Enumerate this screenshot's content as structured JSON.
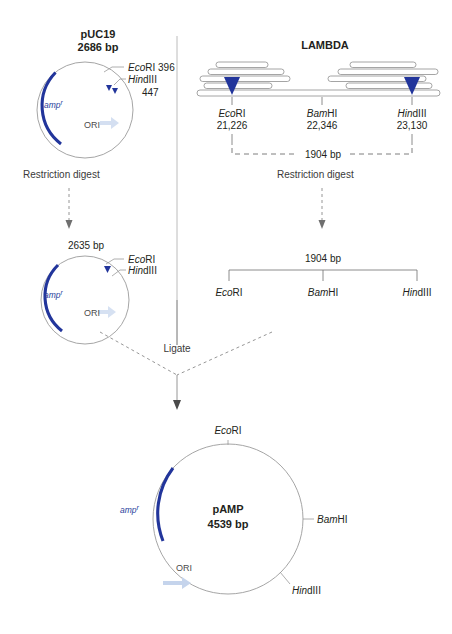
{
  "figure": {
    "colors": {
      "amp_arc": "#22359b",
      "cut_site_marker": "#22359b",
      "ori_arrow": "#c5d4ec",
      "outline": "#9b9b9b",
      "text": "#231f20"
    }
  },
  "panels": {
    "puc19": {
      "name": "pUC19",
      "size": "2686 bp",
      "gene_label": "amp",
      "gene_superscript": "r",
      "ori_label": "ORI",
      "sites": [
        {
          "enzyme_italic": "Eco",
          "enzyme_rest": "RI",
          "position": "396"
        },
        {
          "enzyme_italic": "Hin",
          "enzyme_rest": "dIII",
          "position": "447"
        }
      ]
    },
    "lambda": {
      "name": "LAMBDA",
      "sites": [
        {
          "enzyme_italic": "Eco",
          "enzyme_rest": "RI",
          "position": "21,226"
        },
        {
          "enzyme_italic": "Bam",
          "enzyme_rest": "HI",
          "position": "22,346"
        },
        {
          "enzyme_italic": "Hin",
          "enzyme_rest": "dIII",
          "position": "23,130"
        }
      ],
      "span_label": "1904 bp"
    },
    "digest_left": {
      "label": "Restriction digest"
    },
    "digest_right": {
      "label": "Restriction digest"
    },
    "vector": {
      "size": "2635 bp",
      "gene_label": "amp",
      "gene_superscript": "r",
      "ori_label": "ORI",
      "sites": [
        {
          "enzyme_italic": "Eco",
          "enzyme_rest": "RI"
        },
        {
          "enzyme_italic": "Hin",
          "enzyme_rest": "dIII"
        }
      ]
    },
    "insert": {
      "span_label": "1904 bp",
      "sites": [
        {
          "enzyme_italic": "Eco",
          "enzyme_rest": "RI"
        },
        {
          "enzyme_italic": "Bam",
          "enzyme_rest": "HI"
        },
        {
          "enzyme_italic": "Hin",
          "enzyme_rest": "dIII"
        }
      ]
    },
    "ligate": {
      "label": "Ligate"
    },
    "product": {
      "name": "pAMP",
      "size": "4539 bp",
      "gene_label": "amp",
      "gene_superscript": "r",
      "ori_label": "ORI",
      "sites": [
        {
          "enzyme_italic": "Eco",
          "enzyme_rest": "RI",
          "placement": "top"
        },
        {
          "enzyme_italic": "Bam",
          "enzyme_rest": "HI",
          "placement": "right"
        },
        {
          "enzyme_italic": "Hin",
          "enzyme_rest": "dIII",
          "placement": "bottom-right"
        }
      ]
    }
  }
}
